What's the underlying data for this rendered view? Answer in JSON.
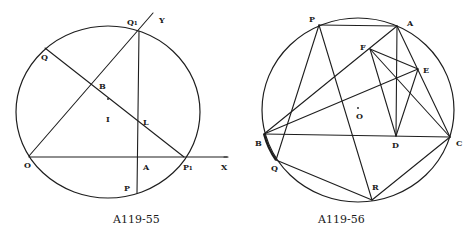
{
  "figures": [
    {
      "id": "fig-a119-55",
      "caption": "A119-55",
      "circle": {
        "cx": 108,
        "cy": 112,
        "rx": 92,
        "ry": 86
      },
      "labels": {
        "Q1": "Q₁",
        "Y": "Y",
        "Q": "Q",
        "B": "B",
        "I": "I",
        "L": "L",
        "O": "O",
        "A": "A",
        "P1": "P₁",
        "X": "X",
        "P": "P"
      },
      "points": {
        "O": [
          29,
          156
        ],
        "Q1": [
          139,
          31
        ],
        "Y_end": [
          153,
          13
        ],
        "Q": [
          45,
          48
        ],
        "B": [
          92,
          85
        ],
        "I_dot": [
          108,
          102
        ],
        "L": [
          138,
          121
        ],
        "A": [
          138,
          157
        ],
        "P1": [
          184,
          157
        ],
        "X_end": [
          227,
          157
        ],
        "P": [
          137,
          193
        ]
      },
      "segments": [
        [
          "O",
          "Y_end"
        ],
        [
          "O",
          "X_end"
        ],
        [
          "Q",
          "P1"
        ],
        [
          "Q1",
          "P"
        ]
      ]
    },
    {
      "id": "fig-a119-56",
      "caption": "A119-56",
      "circle": {
        "cx": 358,
        "cy": 110,
        "rx": 96,
        "ry": 92
      },
      "labels": {
        "P": "P",
        "A": "A",
        "F": "F",
        "E": "E",
        "O": "O",
        "B": "B",
        "D": "D",
        "C": "C",
        "Q": "Q",
        "R": "R"
      },
      "points": {
        "P": [
          319,
          25
        ],
        "A": [
          397,
          26
        ],
        "F": [
          370,
          49
        ],
        "E": [
          418,
          69
        ],
        "O_dot": [
          358,
          108
        ],
        "B": [
          264,
          134
        ],
        "D": [
          396,
          136
        ],
        "C": [
          450,
          137
        ],
        "Q": [
          276,
          160
        ],
        "R": [
          372,
          200
        ]
      },
      "segments": [
        [
          "P",
          "A"
        ],
        [
          "P",
          "Q"
        ],
        [
          "P",
          "R"
        ],
        [
          "A",
          "B"
        ],
        [
          "A",
          "C"
        ],
        [
          "A",
          "D"
        ],
        [
          "F",
          "E"
        ],
        [
          "F",
          "D"
        ],
        [
          "F",
          "C"
        ],
        [
          "E",
          "D"
        ],
        [
          "E",
          "B"
        ],
        [
          "B",
          "C"
        ],
        [
          "B",
          "Q"
        ],
        [
          "Q",
          "R"
        ],
        [
          "R",
          "C"
        ]
      ],
      "thick_arc": [
        "B",
        "Q"
      ]
    }
  ]
}
